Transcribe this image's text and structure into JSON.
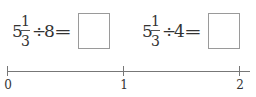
{
  "problems": [
    {
      "whole": "5",
      "numerator": "1",
      "denominator": "3",
      "operator": "÷",
      "divisor": "8",
      "equals": "=",
      "answer": ""
    },
    {
      "whole": "5",
      "numerator": "1",
      "denominator": "3",
      "operator": "÷",
      "divisor": "4",
      "equals": "=",
      "answer": ""
    }
  ],
  "number_line": {
    "ticks": [
      {
        "label": "0",
        "value": 0
      },
      {
        "label": "1",
        "value": 1
      },
      {
        "label": "2",
        "value": 2
      }
    ],
    "line_color": "#777777"
  }
}
